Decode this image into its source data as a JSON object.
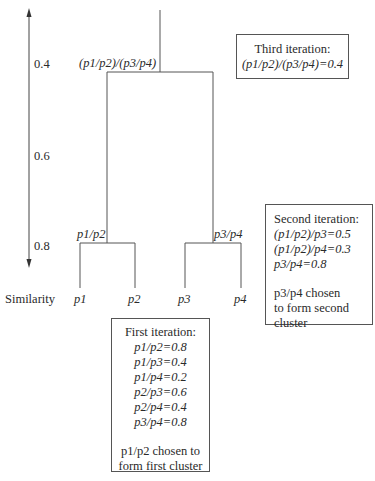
{
  "axis": {
    "label": "Similarity",
    "ticks": [
      "0.4",
      "0.6",
      "0.8"
    ]
  },
  "leaves": [
    "p1",
    "p2",
    "p3",
    "p4"
  ],
  "nodes": {
    "cluster_1": "p1/p2",
    "cluster_2": "p3/p4",
    "cluster_root": "(p1/p2)/(p3/p4)"
  },
  "boxes": {
    "third": {
      "title": "Third iteration:",
      "lines": [
        "(p1/p2)/(p3/p4)=0.4"
      ]
    },
    "second": {
      "title": "Second iteration:",
      "lines": [
        "(p1/p2)/p3=0.5",
        "(p1/p2)/p4=0.3",
        "p3/p4=0.8"
      ],
      "note": [
        "p3/p4 chosen",
        "to form second",
        "cluster"
      ]
    },
    "first": {
      "title": "First iteration:",
      "lines": [
        "p1/p2=0.8",
        "p1/p3=0.4",
        "p1/p4=0.2",
        "p2/p3=0.6",
        "p2/p4=0.4",
        "p3/p4=0.8"
      ],
      "note": [
        "p1/p2 chosen to",
        "form first cluster"
      ]
    }
  }
}
